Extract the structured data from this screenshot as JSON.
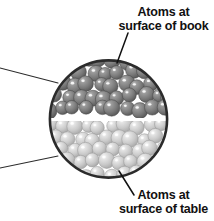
{
  "figure": {
    "kind": "magnified-cross-section-diagram",
    "background_color": "#ffffff"
  },
  "callouts": {
    "book": {
      "name": "atoms-at-surface-of-book",
      "line1": "Atoms at",
      "line2": "surface of book",
      "text_color": "#111111",
      "leader": {
        "x1": 128,
        "y1": 33,
        "x2": 117,
        "y2": 63
      }
    },
    "table": {
      "name": "atoms-at-surface-of-table",
      "line1": "Atoms at",
      "line2": "surface of table",
      "text_color": "#111111",
      "leader": {
        "x1": 134,
        "y1": 194,
        "x2": 119,
        "y2": 171
      }
    }
  },
  "magnifier": {
    "circle": {
      "cx": 108.5,
      "cy": 119,
      "r": 59.5,
      "stroke_color": "#2b2b2b",
      "stroke_width": 2.6,
      "fill_color": "#ffffff"
    },
    "cone_lines": [
      {
        "x1": 0,
        "y1": 68,
        "x2": 57,
        "y2": 83
      },
      {
        "x1": 0,
        "y1": 168,
        "x2": 57,
        "y2": 156
      }
    ],
    "cone_stroke_color": "#2b2b2b",
    "cone_stroke_width": 1.1
  },
  "layers": [
    {
      "id": "book-atoms",
      "label": "book surface atoms",
      "region": "upper",
      "base_color": "#7d7d7d",
      "shade_color": "#5a5a5a",
      "highlight_color": "#d8d8d8",
      "outline_color": "#4a4a4a",
      "rows": 5,
      "atom_radius": 7.4
    },
    {
      "id": "table-atoms",
      "label": "table surface atoms",
      "region": "lower",
      "base_color": "#cacaca",
      "shade_color": "#aaaaaa",
      "highlight_color": "#f4f4f4",
      "outline_color": "#9a9a9a",
      "rows": 5,
      "atom_radius": 7.4
    }
  ],
  "gap": {
    "label": "contact gap between surfaces",
    "color": "#ffffff",
    "y_center": 118
  }
}
